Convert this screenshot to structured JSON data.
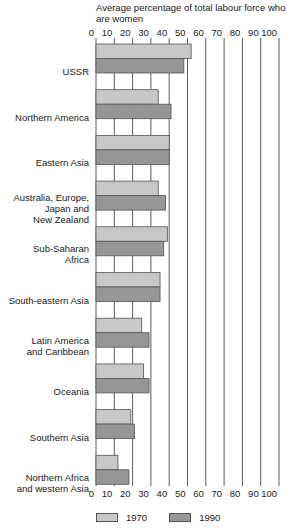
{
  "chart_data": {
    "type": "bar",
    "orientation": "horizontal",
    "title": "Average percentage of total labour force who are women",
    "xlabel": "",
    "ylabel": "",
    "xlim": [
      0,
      100
    ],
    "xticks": [
      0,
      10,
      20,
      30,
      40,
      50,
      60,
      70,
      80,
      90,
      100
    ],
    "grid": true,
    "legend_position": "bottom",
    "categories": [
      [
        "USSR"
      ],
      [
        "Northern America"
      ],
      [
        "Eastern Asia"
      ],
      [
        "Australia, Europe,",
        "Japan and",
        "New Zealand"
      ],
      [
        "Sub-Saharan",
        "Africa"
      ],
      [
        "South-eastern Asia"
      ],
      [
        "Latin America",
        "and Caribbean"
      ],
      [
        "Oceania"
      ],
      [
        "Southern Asia"
      ],
      [
        "Northern Africa",
        "and western Asia"
      ]
    ],
    "series": [
      {
        "name": "1970",
        "color": "#c8c8c8",
        "values": [
          52,
          34,
          40,
          34,
          39,
          35,
          25,
          26,
          19,
          12
        ]
      },
      {
        "name": "1990",
        "color": "#969696",
        "values": [
          48,
          41,
          40,
          38,
          37,
          35,
          29,
          29,
          21,
          18
        ]
      }
    ],
    "border_color": "#555555",
    "grid_color": "#333333"
  }
}
